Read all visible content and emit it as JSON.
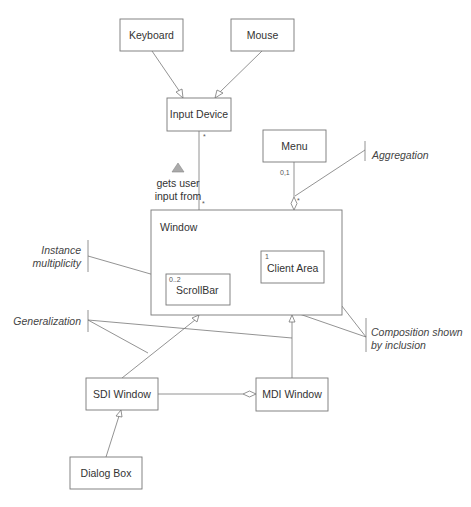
{
  "diagram": {
    "type": "UML class diagram",
    "classes": {
      "keyboard": "Keyboard",
      "mouse": "Mouse",
      "input_device": "Input Device",
      "menu": "Menu",
      "window": "Window",
      "scrollbar": "ScrollBar",
      "client_area": "Client Area",
      "sdi_window": "SDI Window",
      "mdi_window": "MDI Window",
      "dialog_box": "Dialog Box"
    },
    "multiplicities": {
      "input_device_end": "*",
      "window_input_end": "*",
      "menu_end": "0,1",
      "window_menu_end": "*",
      "scrollbar": "0..2",
      "client_area": "1"
    },
    "association": {
      "label_line1": "gets user",
      "label_line2": "input from",
      "direction_marker": "filled-triangle-up"
    },
    "annotations": {
      "aggregation": "Aggregation",
      "instance_multiplicity_line1": "Instance",
      "instance_multiplicity_line2": "multiplicity",
      "generalization": "Generalization",
      "composition_line1": "Composition shown",
      "composition_line2": "by inclusion"
    },
    "relationships": [
      {
        "from": "Keyboard",
        "to": "Input Device",
        "kind": "generalization"
      },
      {
        "from": "Mouse",
        "to": "Input Device",
        "kind": "generalization"
      },
      {
        "from": "Window",
        "to": "Input Device",
        "kind": "association",
        "label": "gets user input from"
      },
      {
        "from": "Window",
        "to": "Menu",
        "kind": "aggregation"
      },
      {
        "from": "Window",
        "to": "ScrollBar",
        "kind": "composition"
      },
      {
        "from": "Window",
        "to": "Client Area",
        "kind": "composition"
      },
      {
        "from": "SDI Window",
        "to": "Window",
        "kind": "generalization"
      },
      {
        "from": "MDI Window",
        "to": "Window",
        "kind": "generalization"
      },
      {
        "from": "MDI Window",
        "to": "SDI Window",
        "kind": "aggregation"
      },
      {
        "from": "Dialog Box",
        "to": "SDI Window",
        "kind": "generalization"
      }
    ]
  }
}
